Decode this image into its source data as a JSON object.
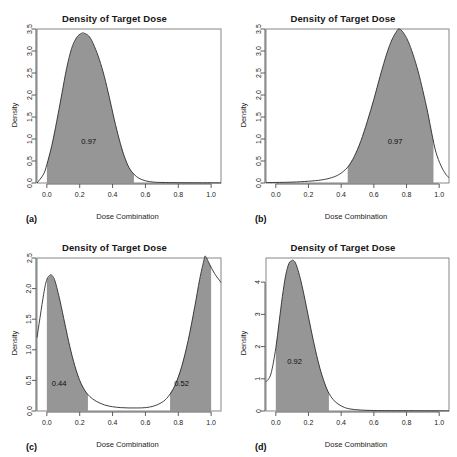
{
  "figure": {
    "panel_count": 4,
    "shared_title": "Density of Target Dose",
    "shared_xlabel": "Dose Combination",
    "shared_ylabel": "Density",
    "fill_color": "#969696",
    "curve_color": "#2b2b2b",
    "axis_color": "#4d4d4d",
    "background": "#ffffff"
  },
  "chart_data": [
    {
      "type": "area",
      "panel": "(a)",
      "title": "Density of Target Dose",
      "xlabel": "Dose Combination",
      "ylabel": "Density",
      "xlim": [
        -0.06,
        1.06
      ],
      "ylim": [
        0,
        3.5
      ],
      "xticks": [
        "0.0",
        "0.2",
        "0.4",
        "0.6",
        "0.8",
        "1.0"
      ],
      "xtick_values": [
        0.0,
        0.2,
        0.4,
        0.6,
        0.8,
        1.0
      ],
      "yticks": [
        "0.0",
        "0.5",
        "1.0",
        "1.5",
        "2.0",
        "2.5",
        "3.0",
        "3.5"
      ],
      "ytick_values": [
        0.0,
        0.5,
        1.0,
        1.5,
        2.0,
        2.5,
        3.0,
        3.5
      ],
      "grid": false,
      "annotation": "0.97",
      "annotation_xy": [
        0.255,
        0.95
      ],
      "shaded_interval": [
        0.0,
        0.53
      ],
      "peak_x": 0.23,
      "peak_y": 3.4,
      "x": [
        -0.06,
        -0.02,
        0.0,
        0.03,
        0.06,
        0.09,
        0.12,
        0.15,
        0.18,
        0.21,
        0.23,
        0.26,
        0.29,
        0.32,
        0.35,
        0.38,
        0.41,
        0.44,
        0.47,
        0.5,
        0.53,
        0.56,
        0.6,
        0.65,
        0.7,
        0.8,
        0.9,
        1.0,
        1.06
      ],
      "y": [
        0.0,
        0.2,
        0.42,
        0.85,
        1.4,
        2.0,
        2.6,
        3.05,
        3.3,
        3.4,
        3.4,
        3.32,
        3.1,
        2.8,
        2.42,
        1.95,
        1.45,
        1.0,
        0.62,
        0.35,
        0.2,
        0.11,
        0.05,
        0.02,
        0.012,
        0.006,
        0.004,
        0.003,
        0.002
      ]
    },
    {
      "type": "area",
      "panel": "(b)",
      "title": "Density of Target Dose",
      "xlabel": "Dose Combination",
      "ylabel": "Density",
      "xlim": [
        -0.06,
        1.06
      ],
      "ylim": [
        0,
        3.5
      ],
      "xticks": [
        "0.0",
        "0.2",
        "0.4",
        "0.6",
        "0.8",
        "1.0"
      ],
      "xtick_values": [
        0.0,
        0.2,
        0.4,
        0.6,
        0.8,
        1.0
      ],
      "yticks": [
        "0.0",
        "0.5",
        "1.0",
        "1.5",
        "2.0",
        "2.5",
        "3.0",
        "3.5"
      ],
      "ytick_values": [
        0.0,
        0.5,
        1.0,
        1.5,
        2.0,
        2.5,
        3.0,
        3.5
      ],
      "grid": false,
      "annotation": "0.97",
      "annotation_xy": [
        0.73,
        0.95
      ],
      "shaded_interval": [
        0.44,
        0.965
      ],
      "peak_x": 0.755,
      "peak_y": 3.5,
      "x": [
        -0.06,
        0.0,
        0.1,
        0.2,
        0.28,
        0.34,
        0.39,
        0.44,
        0.48,
        0.52,
        0.56,
        0.6,
        0.64,
        0.68,
        0.71,
        0.74,
        0.755,
        0.78,
        0.81,
        0.84,
        0.87,
        0.9,
        0.93,
        0.955,
        0.98,
        1.01,
        1.04,
        1.06
      ],
      "y": [
        0.01,
        0.012,
        0.02,
        0.04,
        0.07,
        0.12,
        0.2,
        0.36,
        0.6,
        0.95,
        1.4,
        1.9,
        2.45,
        2.95,
        3.25,
        3.45,
        3.5,
        3.42,
        3.22,
        2.92,
        2.55,
        2.1,
        1.6,
        1.12,
        0.7,
        0.4,
        0.2,
        0.12
      ]
    },
    {
      "type": "area",
      "panel": "(c)",
      "title": "Density of Target Dose",
      "xlabel": "Dose Combination",
      "ylabel": "Density",
      "xlim": [
        -0.06,
        1.06
      ],
      "ylim": [
        0,
        2.5
      ],
      "xticks": [
        "0.0",
        "0.2",
        "0.4",
        "0.6",
        "0.8",
        "1.0"
      ],
      "xtick_values": [
        0.0,
        0.2,
        0.4,
        0.6,
        0.8,
        1.0
      ],
      "yticks": [
        "0.0",
        "0.5",
        "1.0",
        "1.5",
        "2.0",
        "2.5"
      ],
      "ytick_values": [
        0.0,
        0.5,
        1.0,
        1.5,
        2.0,
        2.5
      ],
      "grid": false,
      "annotations": [
        "0.44",
        "0.52"
      ],
      "annotation_xy": [
        [
          0.075,
          0.45
        ],
        [
          0.82,
          0.45
        ]
      ],
      "shaded_intervals": [
        [
          0.0,
          0.25
        ],
        [
          0.75,
          1.0
        ]
      ],
      "bimodal": true,
      "peak_left": {
        "x": 0.03,
        "y": 2.22
      },
      "peak_right": {
        "x": 0.965,
        "y": 2.53
      },
      "x": [
        -0.06,
        -0.02,
        0.0,
        0.02,
        0.03,
        0.05,
        0.08,
        0.11,
        0.14,
        0.17,
        0.2,
        0.23,
        0.26,
        0.3,
        0.35,
        0.4,
        0.45,
        0.5,
        0.55,
        0.6,
        0.65,
        0.7,
        0.74,
        0.78,
        0.82,
        0.86,
        0.9,
        0.93,
        0.955,
        0.965,
        0.99,
        1.02,
        1.06
      ],
      "y": [
        1.2,
        1.9,
        2.15,
        2.22,
        2.22,
        2.12,
        1.8,
        1.42,
        1.05,
        0.74,
        0.5,
        0.34,
        0.24,
        0.16,
        0.1,
        0.07,
        0.055,
        0.05,
        0.05,
        0.055,
        0.08,
        0.14,
        0.24,
        0.42,
        0.72,
        1.15,
        1.7,
        2.15,
        2.45,
        2.53,
        2.4,
        2.25,
        2.1
      ]
    },
    {
      "type": "area",
      "panel": "(d)",
      "title": "Density of Target Dose",
      "xlabel": "Dose Combination",
      "ylabel": "Density",
      "xlim": [
        -0.06,
        1.06
      ],
      "ylim": [
        0,
        4.75
      ],
      "xticks": [
        "0.0",
        "0.2",
        "0.4",
        "0.6",
        "0.8",
        "1.0"
      ],
      "xtick_values": [
        0.0,
        0.2,
        0.4,
        0.6,
        0.8,
        1.0
      ],
      "yticks": [
        "0",
        "1",
        "2",
        "3",
        "4"
      ],
      "ytick_values": [
        0,
        1,
        2,
        3,
        4
      ],
      "grid": false,
      "annotation": "0.92",
      "annotation_xy": [
        0.115,
        1.55
      ],
      "shaded_interval": [
        0.0,
        0.325
      ],
      "peak_x": 0.105,
      "peak_y": 4.68,
      "x": [
        -0.06,
        -0.03,
        0.0,
        0.02,
        0.04,
        0.06,
        0.08,
        0.095,
        0.105,
        0.12,
        0.14,
        0.16,
        0.18,
        0.2,
        0.22,
        0.24,
        0.26,
        0.28,
        0.305,
        0.325,
        0.35,
        0.38,
        0.42,
        0.46,
        0.52,
        0.6,
        0.7,
        0.85,
        1.0,
        1.06
      ],
      "y": [
        0.9,
        1.15,
        1.95,
        2.75,
        3.55,
        4.2,
        4.58,
        4.66,
        4.68,
        4.6,
        4.3,
        3.9,
        3.42,
        2.92,
        2.42,
        1.95,
        1.52,
        1.15,
        0.78,
        0.55,
        0.36,
        0.22,
        0.11,
        0.06,
        0.03,
        0.015,
        0.01,
        0.008,
        0.006,
        0.005
      ]
    }
  ]
}
